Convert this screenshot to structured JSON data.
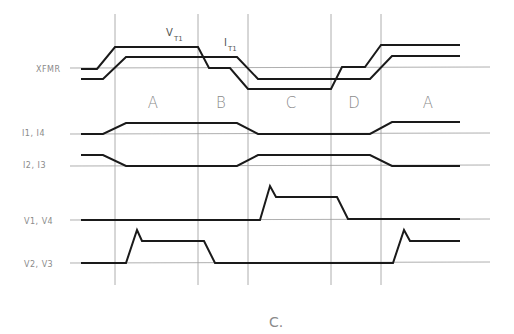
{
  "diagram": {
    "row_labels": {
      "xfmr": "XFMR",
      "i1_i4": "I1, I4",
      "i2_i3": "I2, I3",
      "v1_v4": "V1, V4",
      "v2_v3": "V2, V3"
    },
    "signal_labels": {
      "vt1_main": "V",
      "vt1_sub": "T1",
      "it1_main": "I",
      "it1_sub": "T1"
    },
    "regions": [
      "A",
      "B",
      "C",
      "D",
      "A"
    ],
    "caption": "C.",
    "colors": {
      "trace": "#1a1a1a",
      "grid": "#9a9a9a",
      "label": "#8a8a8a"
    }
  }
}
